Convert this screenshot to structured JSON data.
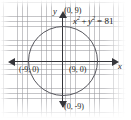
{
  "figure": {
    "equation": {
      "lhs_var1": "x",
      "lhs_exp1": "2",
      "operator": "+",
      "lhs_var2": "y",
      "lhs_exp2": "2",
      "equals": "= 81",
      "full_text": "x² + y² = 81"
    },
    "axis_labels": {
      "x": "x",
      "y": "y"
    },
    "points": {
      "top": "(0, 9)",
      "right": "(9, 0)",
      "left": "(-9, 0)",
      "bottom": "(0, -9)"
    },
    "colors": {
      "grid": "#96969b",
      "axis": "#35353a",
      "curve": "#55555c",
      "text": "#1c1c20",
      "background": "#ffffff"
    }
  },
  "chart_data": {
    "type": "scatter",
    "title": "",
    "xlabel": "x",
    "ylabel": "y",
    "equation": "x^2 + y^2 = 81",
    "shape": "circle",
    "center": [
      0,
      0
    ],
    "radius": 9,
    "grid": true,
    "legend": "none",
    "xlim": [
      -11,
      11
    ],
    "ylim": [
      -11,
      11
    ],
    "annotations": [
      {
        "label": "(0, 9)",
        "x": 0,
        "y": 9
      },
      {
        "label": "(9, 0)",
        "x": 9,
        "y": 0
      },
      {
        "label": "(-9, 0)",
        "x": -9,
        "y": 0
      },
      {
        "label": "(0, -9)",
        "x": 0,
        "y": -9
      },
      {
        "label": "x^2 + y^2 = 81",
        "x": 5,
        "y": 8
      }
    ],
    "series": [
      {
        "name": "x^2 + y^2 = 81",
        "points": [
          [
            9,
            0
          ],
          [
            6.36,
            6.36
          ],
          [
            0,
            9
          ],
          [
            -6.36,
            6.36
          ],
          [
            -9,
            0
          ],
          [
            -6.36,
            -6.36
          ],
          [
            0,
            -9
          ],
          [
            6.36,
            -6.36
          ]
        ]
      }
    ]
  }
}
